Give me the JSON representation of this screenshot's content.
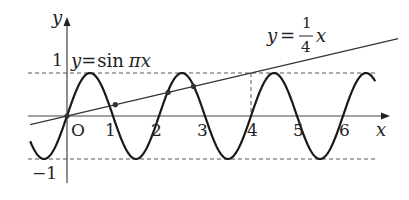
{
  "diagram": {
    "type": "function-graph",
    "curves": [
      {
        "name": "y=sin(pi x)",
        "label_prefix": "y",
        "label_eq": "=",
        "label_func": "sin",
        "label_arg": "πx",
        "x_domain": [
          -0.8,
          6.7
        ]
      },
      {
        "name": "y=x/4",
        "label_prefix": "y",
        "label_eq": "=",
        "numerator": "1",
        "denominator": "4",
        "label_var": "x",
        "x_domain": [
          -0.8,
          7.2
        ]
      }
    ],
    "axes": {
      "x_label": "x",
      "y_label": "y",
      "origin_label": "O",
      "x_ticks": [
        "1",
        "2",
        "3",
        "4",
        "5",
        "6"
      ],
      "y_ticks": [
        "1",
        "−1"
      ],
      "x_range": [
        -0.85,
        7.0
      ],
      "y_range": [
        -1.2,
        2.2
      ]
    },
    "reference_lines": {
      "y_dashed": [
        1,
        -1
      ],
      "x_dashed": 4
    },
    "intersection_points_x": [
      0,
      1.05,
      2.2,
      2.75
    ],
    "colors": {
      "curve": "#1a1a1a",
      "axis": "#444444",
      "dashed": "#555555",
      "point": "#333333"
    }
  }
}
